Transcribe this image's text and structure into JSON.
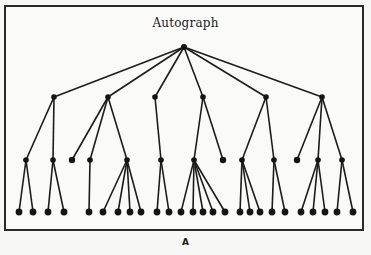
{
  "figure": {
    "title": "Autograph",
    "caption": "A",
    "colors": {
      "line": "#1c1c1c",
      "node": "#141414",
      "border": "#2a2a2a",
      "background": "#fafaf8"
    }
  },
  "tree": {
    "root": {
      "x": 184,
      "y": 47
    },
    "levels_y": [
      47,
      97,
      160,
      212
    ],
    "level1": [
      {
        "x": 54,
        "children": [
          {
            "x": 26,
            "leaves": [
              19,
              33
            ]
          },
          {
            "x": 53,
            "leaves": [
              48,
              64
            ]
          }
        ]
      },
      {
        "x": 108,
        "children": [
          {
            "x": 72,
            "leaves": []
          },
          {
            "x": 90,
            "leaves": [
              89
            ]
          },
          {
            "x": 127,
            "leaves": [
              103,
              118,
              130,
              141
            ]
          }
        ]
      },
      {
        "x": 155,
        "children": [
          {
            "x": 161,
            "leaves": [
              157,
              169
            ]
          }
        ]
      },
      {
        "x": 203,
        "children": [
          {
            "x": 194,
            "leaves": [
              181,
              193,
              203,
              213,
              225
            ]
          },
          {
            "x": 223,
            "leaves": []
          }
        ]
      },
      {
        "x": 266,
        "children": [
          {
            "x": 242,
            "leaves": [
              240,
              250,
              260
            ]
          },
          {
            "x": 274,
            "leaves": [
              272,
              285
            ]
          }
        ]
      },
      {
        "x": 322,
        "children": [
          {
            "x": 297,
            "leaves": []
          },
          {
            "x": 318,
            "leaves": [
              301,
              313,
              325
            ]
          },
          {
            "x": 342,
            "leaves": [
              337,
              353
            ]
          }
        ]
      }
    ]
  }
}
